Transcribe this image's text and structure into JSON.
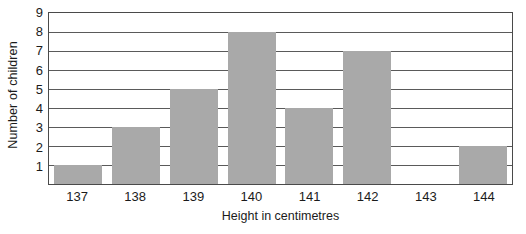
{
  "chart_data": {
    "type": "bar",
    "title": "",
    "xlabel": "Height in centimetres",
    "ylabel": "Number of children",
    "categories": [
      "137",
      "138",
      "139",
      "140",
      "141",
      "142",
      "143",
      "144"
    ],
    "values": [
      1,
      3,
      5,
      8,
      4,
      7,
      0,
      2
    ],
    "yticks": [
      "1",
      "2",
      "3",
      "4",
      "5",
      "6",
      "7",
      "8",
      "9"
    ],
    "ylim": [
      0,
      9
    ],
    "grid": "horizontal",
    "legend": "none",
    "colors": {
      "bar_fill": "#a9a9a9",
      "frame": "#4a4a4a",
      "gridline": "#5a5a5a",
      "background": "#ffffff",
      "text": "#1b1b1b"
    }
  }
}
